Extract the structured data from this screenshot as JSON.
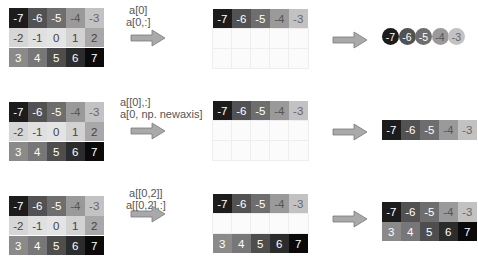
{
  "array": {
    "rows": [
      [
        -7,
        -6,
        -5,
        -4,
        -3
      ],
      [
        -2,
        -1,
        0,
        1,
        2
      ],
      [
        3,
        4,
        5,
        6,
        7
      ]
    ]
  },
  "colors": {
    "-7": "#1c1c1c",
    "-6": "#525252",
    "-5": "#6e6e6e",
    "-4": "#9a9a9a",
    "-3": "#c2c2c2",
    "-2": "#d6d6d6",
    "-1": "#e0e0e0",
    "0": "#e4e4e4",
    "1": "#d2d2d2",
    "2": "#a8a8a8",
    "3": "#8a8a8a",
    "4": "#777777",
    "5": "#4e4e4e",
    "6": "#2c2c2c",
    "7": "#0a0a0a"
  },
  "text_colors": {
    "-2": "#444",
    "-1": "#444",
    "0": "#444",
    "1": "#444",
    "2": "#444",
    "-3": "#666",
    "-4": "#555"
  },
  "examples": [
    {
      "labels": [
        "a[0]",
        "a[0,:]"
      ],
      "selected_rows": [
        0
      ],
      "result_shape": "1d",
      "result": [
        -7,
        -6,
        -5,
        -4,
        -3
      ]
    },
    {
      "labels": [
        "a[[0],:]",
        "a[0, np. newaxis]"
      ],
      "selected_rows": [
        0
      ],
      "result_shape": "2d",
      "result": [
        [
          -7,
          -6,
          -5,
          -4,
          -3
        ]
      ]
    },
    {
      "labels": [
        "a[[0,2]]",
        "a[[0,2],:]"
      ],
      "selected_rows": [
        0,
        2
      ],
      "result_shape": "2d",
      "result": [
        [
          -7,
          -6,
          -5,
          -4,
          -3
        ],
        [
          3,
          4,
          5,
          6,
          7
        ]
      ]
    }
  ],
  "arrow_color": "#a9a9a9",
  "arrow_stroke": "#7a7a7a"
}
